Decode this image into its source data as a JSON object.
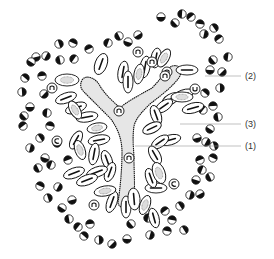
{
  "diagram": {
    "type": "histology-illustration",
    "background": "#ffffff",
    "ink_color": "#111111",
    "duct_fill": "#e6e6e6",
    "leader_color": "#999999",
    "labels": [
      {
        "id": "label-2",
        "text": "(2)",
        "x": 245,
        "y": 71,
        "line": {
          "x1": 205,
          "y1": 76,
          "x2": 241,
          "y2": 76
        }
      },
      {
        "id": "label-3",
        "text": "(3)",
        "x": 245,
        "y": 119,
        "line": {
          "x1": 180,
          "y1": 124,
          "x2": 241,
          "y2": 124
        }
      },
      {
        "id": "label-1",
        "text": "(1)",
        "x": 245,
        "y": 141,
        "line": {
          "x1": 135,
          "y1": 146,
          "x2": 241,
          "y2": 146
        }
      }
    ],
    "duct_path": "M82,80 C86,74 96,78 100,86 C106,96 114,102 120,108 C126,102 138,96 152,88 C160,80 168,68 172,66 C180,64 182,70 180,76 C174,86 160,96 150,104 C142,112 136,118 134,126 C132,140 134,150 134,160 C134,176 136,194 132,205 C126,210 118,208 118,202 C120,190 122,170 122,152 C122,140 118,128 110,118 C100,108 90,98 84,92 C80,88 80,84 82,80 Z",
    "round_cells": [
      [
        161,
        17
      ],
      [
        175,
        23
      ],
      [
        182,
        14
      ],
      [
        191,
        17
      ],
      [
        200,
        24
      ],
      [
        214,
        28
      ],
      [
        204,
        34
      ],
      [
        138,
        35
      ],
      [
        128,
        42
      ],
      [
        119,
        36
      ],
      [
        108,
        43
      ],
      [
        89,
        49
      ],
      [
        73,
        43
      ],
      [
        59,
        44
      ],
      [
        46,
        56
      ],
      [
        36,
        57
      ],
      [
        31,
        62
      ],
      [
        60,
        60
      ],
      [
        74,
        59
      ],
      [
        42,
        76
      ],
      [
        25,
        78
      ],
      [
        22,
        92
      ],
      [
        44,
        94
      ],
      [
        30,
        107
      ],
      [
        24,
        116
      ],
      [
        47,
        113
      ],
      [
        23,
        126
      ],
      [
        50,
        126
      ],
      [
        40,
        138
      ],
      [
        30,
        148
      ],
      [
        57,
        143
      ],
      [
        45,
        158
      ],
      [
        38,
        168
      ],
      [
        51,
        165
      ],
      [
        68,
        160
      ],
      [
        40,
        186
      ],
      [
        48,
        198
      ],
      [
        58,
        187
      ],
      [
        72,
        200
      ],
      [
        62,
        208
      ],
      [
        69,
        219
      ],
      [
        78,
        227
      ],
      [
        90,
        224
      ],
      [
        84,
        236
      ],
      [
        99,
        240
      ],
      [
        112,
        244
      ],
      [
        127,
        239
      ],
      [
        131,
        224
      ],
      [
        148,
        218
      ],
      [
        165,
        211
      ],
      [
        172,
        220
      ],
      [
        180,
        206
      ],
      [
        190,
        195
      ],
      [
        200,
        194
      ],
      [
        196,
        180
      ],
      [
        210,
        177
      ],
      [
        202,
        170
      ],
      [
        200,
        160
      ],
      [
        213,
        158
      ],
      [
        214,
        146
      ],
      [
        206,
        142
      ],
      [
        197,
        138
      ],
      [
        210,
        129
      ],
      [
        218,
        117
      ],
      [
        203,
        110
      ],
      [
        213,
        106
      ],
      [
        205,
        93
      ],
      [
        220,
        88
      ],
      [
        222,
        72
      ],
      [
        210,
        70
      ],
      [
        213,
        60
      ],
      [
        228,
        57
      ],
      [
        219,
        39
      ],
      [
        167,
        231
      ],
      [
        184,
        230
      ],
      [
        150,
        235
      ]
    ],
    "oval_cells": [
      [
        101,
        64,
        6,
        11,
        20,
        "bar"
      ],
      [
        123,
        72,
        5,
        11,
        10,
        "bar"
      ],
      [
        128,
        82,
        5,
        11,
        0,
        "bar"
      ],
      [
        145,
        67,
        5,
        11,
        10,
        "bar"
      ],
      [
        156,
        58,
        5,
        10,
        10,
        "bar"
      ],
      [
        187,
        70,
        11,
        5,
        0,
        "bar"
      ],
      [
        193,
        108,
        11,
        5,
        -15,
        "bar"
      ],
      [
        183,
        95,
        11,
        5,
        -20,
        "bar"
      ],
      [
        171,
        99,
        10,
        5,
        -30,
        "bar"
      ],
      [
        164,
        106,
        10,
        5,
        -35,
        "bar"
      ],
      [
        156,
        115,
        5,
        10,
        -20,
        "bar"
      ],
      [
        152,
        128,
        10,
        5,
        -25,
        "bar"
      ],
      [
        170,
        140,
        11,
        5,
        -15,
        "bar"
      ],
      [
        160,
        142,
        10,
        5,
        -35,
        "bar"
      ],
      [
        155,
        155,
        5,
        10,
        -30,
        "bar"
      ],
      [
        156,
        188,
        11,
        5,
        0,
        "bar"
      ],
      [
        151,
        178,
        5,
        10,
        -20,
        "bar"
      ],
      [
        66,
        98,
        11,
        5,
        -20,
        "bar"
      ],
      [
        76,
        108,
        11,
        5,
        -20,
        "bar"
      ],
      [
        87,
        117,
        11,
        5,
        -10,
        "bar"
      ],
      [
        99,
        140,
        11,
        5,
        -10,
        "bar"
      ],
      [
        76,
        140,
        5,
        10,
        30,
        "bar"
      ],
      [
        94,
        154,
        5,
        11,
        10,
        "bar"
      ],
      [
        107,
        160,
        5,
        10,
        -20,
        "bar"
      ],
      [
        110,
        172,
        5,
        10,
        20,
        "bar"
      ],
      [
        97,
        172,
        11,
        5,
        -20,
        "bar"
      ],
      [
        87,
        180,
        11,
        5,
        -20,
        "bar"
      ],
      [
        74,
        173,
        11,
        5,
        -20,
        "bar"
      ],
      [
        112,
        202,
        5,
        11,
        20,
        "bar"
      ],
      [
        126,
        207,
        5,
        11,
        0,
        "bar"
      ],
      [
        154,
        218,
        5,
        10,
        -15,
        "bar"
      ],
      [
        134,
        199,
        6,
        11,
        -5,
        "bar"
      ]
    ],
    "granular_cells": [
      [
        67,
        80,
        12,
        6,
        0
      ],
      [
        75,
        110,
        5,
        10,
        -30
      ],
      [
        97,
        128,
        10,
        5,
        -10
      ],
      [
        139,
        74,
        5,
        10,
        10
      ],
      [
        164,
        58,
        5,
        10,
        30
      ],
      [
        182,
        97,
        11,
        5,
        0
      ],
      [
        159,
        173,
        6,
        11,
        -20
      ],
      [
        105,
        191,
        11,
        5,
        -10
      ],
      [
        145,
        205,
        5,
        10,
        20
      ],
      [
        80,
        150,
        5,
        10,
        -20
      ]
    ],
    "nucleus_cells": [
      [
        52,
        88,
        "n"
      ],
      [
        57,
        141,
        "c"
      ],
      [
        138,
        52,
        "n"
      ],
      [
        152,
        62,
        "n"
      ],
      [
        167,
        72,
        "n"
      ],
      [
        195,
        89,
        "u"
      ],
      [
        119,
        111,
        "n"
      ],
      [
        129,
        158,
        "n"
      ],
      [
        174,
        184,
        "c"
      ],
      [
        94,
        205,
        "n"
      ],
      [
        165,
        76,
        "n"
      ]
    ]
  }
}
